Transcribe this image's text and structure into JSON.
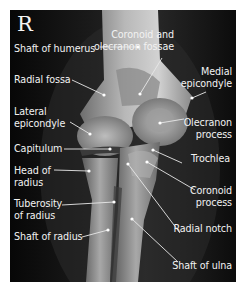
{
  "figure": {
    "side_marker": "R",
    "background": "#0b0b0b",
    "label_color": "#f2f2f2",
    "labels": [
      {
        "id": "shaft-of-humerus",
        "lines": [
          "Shaft of humerus"
        ],
        "x": 4,
        "y": 33,
        "align": "left",
        "pointer": [
          [
            90,
            37
          ],
          [
            128,
            37
          ]
        ]
      },
      {
        "id": "radial-fossa",
        "lines": [
          "Radial fossa"
        ],
        "x": 4,
        "y": 64,
        "align": "left",
        "pointer": [
          [
            62,
            70
          ],
          [
            94,
            85
          ]
        ]
      },
      {
        "id": "lateral-epicondyle",
        "lines": [
          "Lateral",
          "epicondyle"
        ],
        "x": 4,
        "y": 96,
        "align": "left",
        "pointer": [
          [
            60,
            112
          ],
          [
            80,
            124
          ]
        ]
      },
      {
        "id": "capitulum",
        "lines": [
          "Capitulum"
        ],
        "x": 4,
        "y": 133,
        "align": "left",
        "pointer": [
          [
            54,
            139
          ],
          [
            100,
            139
          ]
        ]
      },
      {
        "id": "head-of-radius",
        "lines": [
          "Head of",
          "radius"
        ],
        "x": 4,
        "y": 155,
        "align": "left",
        "pointer": [
          [
            44,
            160
          ],
          [
            79,
            161
          ]
        ]
      },
      {
        "id": "tuberosity-of-radius",
        "lines": [
          "Tuberosity",
          "of radius"
        ],
        "x": 4,
        "y": 188,
        "align": "left",
        "pointer": [
          [
            52,
            195
          ],
          [
            104,
            192
          ]
        ]
      },
      {
        "id": "shaft-of-radius",
        "lines": [
          "Shaft of radius"
        ],
        "x": 4,
        "y": 221,
        "align": "left",
        "pointer": [
          [
            72,
            227
          ],
          [
            98,
            220
          ]
        ]
      },
      {
        "id": "coronoid-olecranon-fossae",
        "lines": [
          "Coronoid and",
          "olecranon fossae"
        ],
        "x": 164,
        "y": 19,
        "align": "right",
        "pointer": [
          [
            152,
            48
          ],
          [
            130,
            84
          ]
        ]
      },
      {
        "id": "medial-epicondyle",
        "lines": [
          "Medial",
          "epicondyle"
        ],
        "x": 222,
        "y": 56,
        "align": "right",
        "pointer": [
          [
            196,
            82
          ],
          [
            182,
            88
          ]
        ]
      },
      {
        "id": "olecranon-process",
        "lines": [
          "Olecranon",
          "process"
        ],
        "x": 222,
        "y": 107,
        "align": "right",
        "pointer": [
          [
            174,
            109
          ],
          [
            150,
            113
          ]
        ]
      },
      {
        "id": "trochlea",
        "lines": [
          "Trochlea"
        ],
        "x": 220,
        "y": 143,
        "align": "right",
        "pointer": [
          [
            172,
            153
          ],
          [
            143,
            140
          ]
        ]
      },
      {
        "id": "coronoid-process",
        "lines": [
          "Coronoid",
          "process"
        ],
        "x": 222,
        "y": 175,
        "align": "right",
        "pointer": [
          [
            185,
            180
          ],
          [
            137,
            152
          ]
        ]
      },
      {
        "id": "radial-notch",
        "lines": [
          "Radial notch"
        ],
        "x": 222,
        "y": 213,
        "align": "right",
        "pointer": [
          [
            170,
            223
          ],
          [
            118,
            154
          ]
        ]
      },
      {
        "id": "shaft-of-ulna",
        "lines": [
          "Shaft of ulna"
        ],
        "x": 222,
        "y": 250,
        "align": "right",
        "pointer": [
          [
            168,
            252
          ],
          [
            122,
            209
          ]
        ]
      }
    ]
  }
}
